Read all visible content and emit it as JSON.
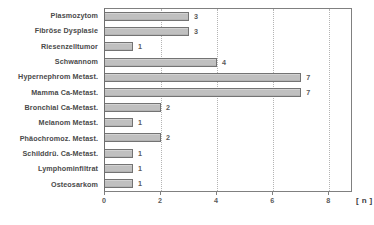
{
  "chart_data": {
    "type": "bar",
    "orientation": "horizontal",
    "title": "",
    "subtitle": "",
    "xlabel": "[ n ]",
    "ylabel": "",
    "xlim": [
      0,
      8.85
    ],
    "xticks": [
      0,
      2,
      4,
      6,
      8
    ],
    "xticklabels": [
      "0",
      "2",
      "4",
      "6",
      "8"
    ],
    "grid": "vertical-dotted",
    "legend": "none",
    "categories": [
      "Plasmozytom",
      "Fibröse Dysplasie",
      "Riesenzelltumor",
      "Schwannom",
      "Hypernephrom Metast.",
      "Mamma Ca-Metast.",
      "Bronchial Ca-Metast.",
      "Melanom Metast.",
      "Phäochromoz. Metast.",
      "Schilddrü. Ca-Metast.",
      "Lymphominfiltrat",
      "Osteosarkom"
    ],
    "values": [
      3,
      3,
      1,
      4,
      7,
      7,
      2,
      1,
      2,
      1,
      1,
      1
    ],
    "value_labels": [
      "3",
      "3",
      "1",
      "4",
      "7",
      "7",
      "2",
      "1",
      "2",
      "1",
      "1",
      "1"
    ],
    "colors": {
      "bar_fill": "#c0c0c0",
      "bar_border": "#737373",
      "grid": "#b4b4b4",
      "axis": "#808080",
      "text": "#4a4a4a",
      "background": "#ffffff"
    }
  }
}
